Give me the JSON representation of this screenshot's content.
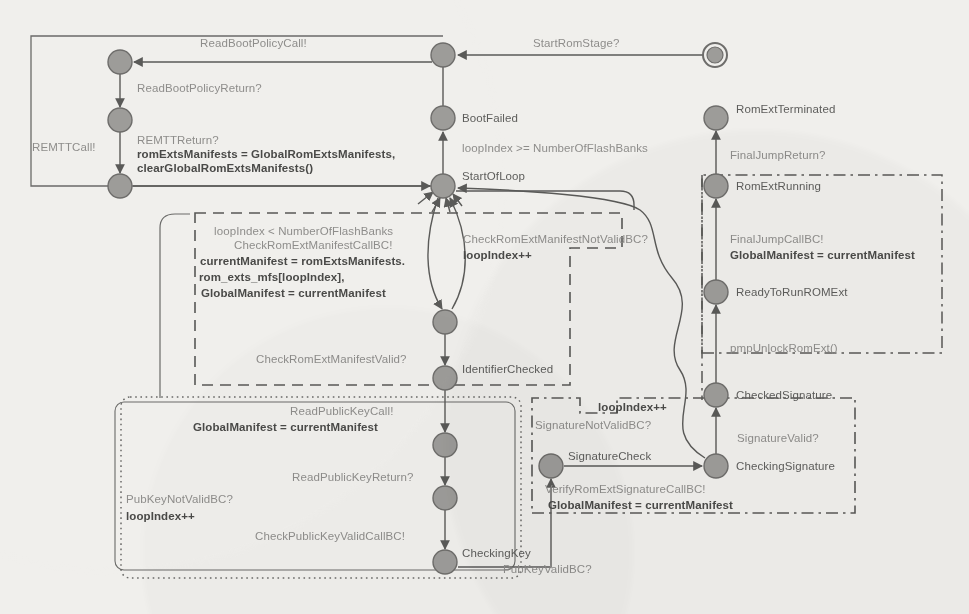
{
  "diagram": {
    "type": "state-machine",
    "colors": {
      "background": "#f0efec",
      "node_fill": "#9d9c99",
      "node_stroke": "#6e6d6b",
      "edge": "#5a5a58",
      "label_light": "#8e8d8b",
      "label_dark": "#4a4a48"
    },
    "states": [
      {
        "id": "initial",
        "label": "",
        "x": 715,
        "y": 55,
        "kind": "initial"
      },
      {
        "id": "romstage",
        "label": "",
        "x": 443,
        "y": 55,
        "kind": "normal"
      },
      {
        "id": "bootpolicy",
        "label": "",
        "x": 120,
        "y": 62,
        "kind": "normal"
      },
      {
        "id": "bootpolicyread",
        "label": "",
        "x": 120,
        "y": 120,
        "kind": "normal"
      },
      {
        "id": "remtdone",
        "label": "",
        "x": 120,
        "y": 186,
        "kind": "normal"
      },
      {
        "id": "bootfailed",
        "label": "BootFailed",
        "x": 443,
        "y": 118,
        "kind": "normal"
      },
      {
        "id": "startofloop",
        "label": "StartOfLoop",
        "x": 443,
        "y": 186,
        "kind": "normal"
      },
      {
        "id": "manifestchecked",
        "label": "",
        "x": 445,
        "y": 322,
        "kind": "normal"
      },
      {
        "id": "identifierchecked",
        "label": "IdentifierChecked",
        "x": 445,
        "y": 378,
        "kind": "normal"
      },
      {
        "id": "pubkeyread",
        "label": "",
        "x": 445,
        "y": 445,
        "kind": "normal"
      },
      {
        "id": "pubkeyreturned",
        "label": "",
        "x": 445,
        "y": 498,
        "kind": "normal"
      },
      {
        "id": "checkingkey",
        "label": "CheckingKey",
        "x": 445,
        "y": 562,
        "kind": "normal"
      },
      {
        "id": "romextterminated",
        "label": "RomExtTerminated",
        "x": 716,
        "y": 118,
        "kind": "normal"
      },
      {
        "id": "romextrunning",
        "label": "RomExtRunning",
        "x": 716,
        "y": 186,
        "kind": "normal"
      },
      {
        "id": "readytorunromext",
        "label": "ReadyToRunROMExt",
        "x": 716,
        "y": 292,
        "kind": "normal"
      },
      {
        "id": "checkedsignature",
        "label": "CheckedSignature",
        "x": 716,
        "y": 395,
        "kind": "normal"
      },
      {
        "id": "checkingsignature",
        "label": "CheckingSignature",
        "x": 716,
        "y": 466,
        "kind": "normal"
      },
      {
        "id": "signaturecheck",
        "label": "SignatureCheck",
        "x": 551,
        "y": 466,
        "kind": "normal"
      }
    ],
    "edge_labels": [
      {
        "id": "start-rom-stage",
        "text": "StartRomStage?",
        "x": 533,
        "y": 36,
        "style": "light"
      },
      {
        "id": "read-boot-policy-call",
        "text": "ReadBootPolicyCall!",
        "x": 200,
        "y": 36,
        "style": "light"
      },
      {
        "id": "read-boot-policy-return",
        "text": "ReadBootPolicyReturn?",
        "x": 137,
        "y": 81,
        "style": "light"
      },
      {
        "id": "remt-call",
        "text": "REMTTCall!",
        "x": 32,
        "y": 140,
        "style": "light"
      },
      {
        "id": "remt-return",
        "text": "REMTTReturn?",
        "x": 137,
        "y": 133,
        "style": "light"
      },
      {
        "id": "rom-exts-manifests",
        "text": "romExtsManifests = GlobalRomExtsManifests,",
        "x": 137,
        "y": 147,
        "style": "dark"
      },
      {
        "id": "clear-global",
        "text": "clearGlobalRomExtsManifests()",
        "x": 137,
        "y": 161,
        "style": "dark"
      },
      {
        "id": "boot-failed-guard",
        "text": "loopIndex >= NumberOfFlashBanks",
        "x": 462,
        "y": 141,
        "style": "light"
      },
      {
        "id": "loop-guard",
        "text": "loopIndex < NumberOfFlashBanks",
        "x": 214,
        "y": 224,
        "style": "light"
      },
      {
        "id": "check-manifest-call",
        "text": "CheckRomExtManifestCallBC!",
        "x": 234,
        "y": 238,
        "style": "light"
      },
      {
        "id": "current-manifest",
        "text": "currentManifest = romExtsManifests.",
        "x": 200,
        "y": 254,
        "style": "dark"
      },
      {
        "id": "rom-exts-mfs",
        "text": "rom_exts_mfs[loopIndex],",
        "x": 199,
        "y": 270,
        "style": "dark"
      },
      {
        "id": "global-manifest-1",
        "text": "GlobalManifest = currentManifest",
        "x": 201,
        "y": 286,
        "style": "dark"
      },
      {
        "id": "check-manifest-notvalid",
        "text": "CheckRomExtManifestNotValidBC?",
        "x": 463,
        "y": 232,
        "style": "light"
      },
      {
        "id": "loop-index-pp-1",
        "text": "loopIndex++",
        "x": 463,
        "y": 248,
        "style": "dark"
      },
      {
        "id": "check-manifest-valid",
        "text": "CheckRomExtManifestValid?",
        "x": 256,
        "y": 352,
        "style": "light"
      },
      {
        "id": "read-pubkey-call",
        "text": "ReadPublicKeyCall!",
        "x": 290,
        "y": 404,
        "style": "light"
      },
      {
        "id": "global-manifest-2",
        "text": "GlobalManifest = currentManifest",
        "x": 193,
        "y": 420,
        "style": "dark"
      },
      {
        "id": "read-pubkey-return",
        "text": "ReadPublicKeyReturn?",
        "x": 292,
        "y": 470,
        "style": "light"
      },
      {
        "id": "pubkey-notvalid",
        "text": "PubKeyNotValidBC?",
        "x": 126,
        "y": 492,
        "style": "light"
      },
      {
        "id": "loop-index-pp-2",
        "text": "loopIndex++",
        "x": 126,
        "y": 509,
        "style": "dark"
      },
      {
        "id": "check-pubkey-valid",
        "text": "CheckPublicKeyValidCallBC!",
        "x": 255,
        "y": 529,
        "style": "light"
      },
      {
        "id": "pubkey-valid",
        "text": "PubKeyValidBC?",
        "x": 503,
        "y": 562,
        "style": "light"
      },
      {
        "id": "final-jump-return",
        "text": "FinalJumpReturn?",
        "x": 730,
        "y": 148,
        "style": "light"
      },
      {
        "id": "final-jump-call",
        "text": "FinalJumpCallBC!",
        "x": 730,
        "y": 232,
        "style": "light"
      },
      {
        "id": "global-manifest-3",
        "text": "GlobalManifest = currentManifest",
        "x": 730,
        "y": 248,
        "style": "dark"
      },
      {
        "id": "pmp-unlock",
        "text": "pmpUnlockRomExt()",
        "x": 730,
        "y": 341,
        "style": "light"
      },
      {
        "id": "signature-valid",
        "text": "SignatureValid?",
        "x": 737,
        "y": 431,
        "style": "light"
      },
      {
        "id": "loop-index-pp-3",
        "text": "loopIndex++",
        "x": 598,
        "y": 400,
        "style": "dark"
      },
      {
        "id": "signature-notvalid",
        "text": "SignatureNotValidBC?",
        "x": 535,
        "y": 418,
        "style": "light"
      },
      {
        "id": "verify-signature-call",
        "text": "VerifyRomExtSignatureCallBC!",
        "x": 545,
        "y": 482,
        "style": "light"
      },
      {
        "id": "global-manifest-4",
        "text": "GlobalManifest = currentManifest",
        "x": 548,
        "y": 498,
        "style": "dark"
      }
    ],
    "state_labels": [
      {
        "id": "label-bootfailed",
        "text": "BootFailed",
        "x": 462,
        "y": 111
      },
      {
        "id": "label-startofloop",
        "text": "StartOfLoop",
        "x": 462,
        "y": 169
      },
      {
        "id": "label-identifierchecked",
        "text": "IdentifierChecked",
        "x": 462,
        "y": 362
      },
      {
        "id": "label-checkingkey",
        "text": "CheckingKey",
        "x": 462,
        "y": 546
      },
      {
        "id": "label-romextterminated",
        "text": "RomExtTerminated",
        "x": 736,
        "y": 102
      },
      {
        "id": "label-romextrunning",
        "text": "RomExtRunning",
        "x": 736,
        "y": 179
      },
      {
        "id": "label-readytorun",
        "text": "ReadyToRunROMExt",
        "x": 736,
        "y": 285
      },
      {
        "id": "label-checkedsignature",
        "text": "CheckedSignature",
        "x": 736,
        "y": 388
      },
      {
        "id": "label-checkingsignature",
        "text": "CheckingSignature",
        "x": 736,
        "y": 459
      },
      {
        "id": "label-signaturecheck",
        "text": "SignatureCheck",
        "x": 568,
        "y": 449
      }
    ],
    "regions": [
      {
        "id": "region-boot-policy",
        "style": "solid",
        "x": 31,
        "y": 36,
        "w": 413,
        "h": 151
      },
      {
        "id": "region-manifest",
        "style": "dashed",
        "x": 195,
        "y": 213,
        "w": 427,
        "h": 172
      },
      {
        "id": "region-pubkey",
        "style": "dotted",
        "x": 121,
        "y": 397,
        "w": 400,
        "h": 181
      },
      {
        "id": "region-signature",
        "style": "dashdot",
        "x": 532,
        "y": 398,
        "w": 323,
        "h": 115
      },
      {
        "id": "region-romext",
        "style": "dashdot",
        "x": 702,
        "y": 175,
        "w": 240,
        "h": 178
      }
    ]
  }
}
